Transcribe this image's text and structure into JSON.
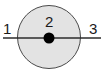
{
  "diagram": {
    "type": "annotated-circle-with-axis",
    "width": 106,
    "height": 75,
    "background_color": "#ffffff",
    "shapes": {
      "outer_circle": {
        "name": "outer-circle",
        "center_x": 49,
        "center_y": 37,
        "radius": 32,
        "fill_color": "#e3e3e3",
        "stroke_color": "#4a4a4a",
        "stroke_width": 1
      },
      "center_dot": {
        "name": "center-dot",
        "center_x": 49,
        "center_y": 38,
        "radius": 5.5,
        "fill_color": "#000000"
      },
      "horizontal_line": {
        "name": "horizontal-axis-line",
        "x1": 3,
        "y1": 38,
        "x2": 101,
        "y2": 38,
        "stroke_color": "#2b2b2b",
        "stroke_width": 1.6
      }
    },
    "labels": [
      {
        "id": "1",
        "text": "1",
        "position": "left-outside",
        "x": 3,
        "y": 21
      },
      {
        "id": "2",
        "text": "2",
        "position": "center-above-dot",
        "x": 45,
        "y": 14
      },
      {
        "id": "3",
        "text": "3",
        "position": "right-outside",
        "x": 89,
        "y": 21
      }
    ],
    "label_color": "#1a1a1a"
  }
}
